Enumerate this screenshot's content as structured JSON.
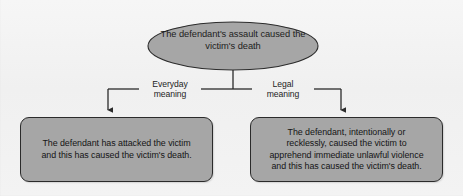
{
  "diagram": {
    "type": "flowchart",
    "colors": {
      "background": "#f2f2f2",
      "node_fill": "#a6a6a6",
      "node_border": "#2b2b2b",
      "connector": "#2b2b2b",
      "text": "#1d1d1d"
    },
    "root": {
      "shape": "ellipse",
      "line1": "The defendant's assault caused",
      "line2": "the victim's death"
    },
    "branches": [
      {
        "id": "everyday",
        "label_line1": "Everyday",
        "label_line2": "meaning",
        "direction": "left"
      },
      {
        "id": "legal",
        "label_line1": "Legal",
        "label_line2": "meaning",
        "direction": "right"
      }
    ],
    "outcomes": [
      {
        "id": "everyday-outcome",
        "shape": "rounded-rectangle",
        "lines": [
          "The defendant has attacked the victim",
          "and this has caused the victim's death."
        ]
      },
      {
        "id": "legal-outcome",
        "shape": "rounded-rectangle",
        "lines": [
          "The defendant, intentionally or",
          "recklessly, caused the victim to",
          "apprehend immediate unlawful violence",
          "and this has caused the victim's death."
        ]
      }
    ]
  }
}
